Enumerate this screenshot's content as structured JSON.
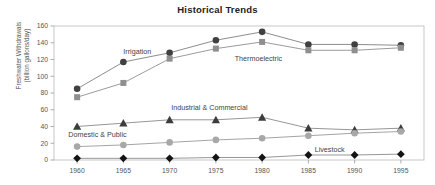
{
  "chart_data": {
    "type": "line",
    "title": "Historical Trends",
    "xlabel": "",
    "ylabel": "Freshwater Withdrawals\n(billion gallons/day)",
    "ylabel_line1": "Freshwater Withdrawals",
    "ylabel_line2": "(billion gallons/day)",
    "categories": [
      1960,
      1965,
      1970,
      1975,
      1980,
      1985,
      1990,
      1995
    ],
    "x_tick_labels": [
      "1960",
      "1965",
      "1970",
      "1975",
      "1980",
      "1985",
      "1990",
      "1995"
    ],
    "y_tick_labels": [
      "0",
      "20",
      "40",
      "60",
      "80",
      "100",
      "120",
      "140",
      "160"
    ],
    "y_ticks": [
      0,
      20,
      40,
      60,
      80,
      100,
      120,
      140,
      160
    ],
    "ylim": [
      0,
      160
    ],
    "xlim": [
      1957.5,
      1997.5
    ],
    "grid": false,
    "legend": "inline-annotations",
    "series": [
      {
        "name": "Irrigation",
        "marker": "circle",
        "color": "#404040",
        "line_color": "#808080",
        "label_x": 1966.5,
        "label_y": 126,
        "values": [
          85,
          117,
          128,
          143,
          153,
          138,
          138,
          137
        ]
      },
      {
        "name": "Thermoelectric",
        "marker": "square",
        "color": "#8f8f8f",
        "line_color": "#909090",
        "label_x": 1979.6,
        "label_y": 118,
        "values": [
          75,
          92,
          121,
          133,
          141,
          131,
          131,
          134
        ]
      },
      {
        "name": "Industrial & Commercial",
        "marker": "triangle",
        "color": "#3c3c3c",
        "line_color": "#8a8a8a",
        "label_x": 1974.3,
        "label_y": 60,
        "values": [
          40,
          44,
          48,
          48,
          51,
          38,
          36,
          38
        ]
      },
      {
        "name": "Domestic & Public",
        "marker": "circle",
        "color": "#a8a8a8",
        "line_color": "#9a9a9a",
        "label_x": 1962.2,
        "label_y": 28,
        "values": [
          16,
          18,
          21,
          24,
          26,
          29,
          32,
          34
        ]
      },
      {
        "name": "Livestock",
        "marker": "diamond",
        "color": "#141414",
        "line_color": "#8a8a8a",
        "label_x": 1987.3,
        "label_y": 9,
        "values": [
          2,
          2,
          2,
          3,
          3,
          6,
          6,
          7
        ]
      }
    ]
  }
}
